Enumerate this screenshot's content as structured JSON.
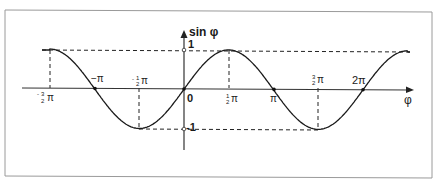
{
  "diagram": {
    "y_axis_label": "sin φ",
    "x_axis_label": "φ",
    "origin_label": "0",
    "y_ticks": [
      {
        "value": 1,
        "label": "1"
      },
      {
        "value": -1,
        "label": "-1"
      }
    ],
    "x_ticks": [
      {
        "value": "-3/2π",
        "num": "3",
        "den": "2",
        "sign": "-",
        "label": "-3/2 π"
      },
      {
        "value": "-π",
        "label": "−π"
      },
      {
        "value": "-1/2π",
        "num": "1",
        "den": "2",
        "sign": "-",
        "label": "-1/2 π"
      },
      {
        "value": "1/2π",
        "num": "1",
        "den": "2",
        "sign": "",
        "label": "1/2 π"
      },
      {
        "value": "π",
        "label": "π"
      },
      {
        "value": "3/2π",
        "num": "3",
        "den": "2",
        "sign": "",
        "label": "3/2 π"
      },
      {
        "value": "2π",
        "label": "2π"
      }
    ],
    "pi_symbol": "π",
    "function": "sin φ",
    "domain": "[-3/2π, 5/2π]",
    "colors": {
      "curve": "#1a1a1a",
      "axes": "#333333",
      "guides": "#222222",
      "frame": "#9a9a9a"
    }
  }
}
